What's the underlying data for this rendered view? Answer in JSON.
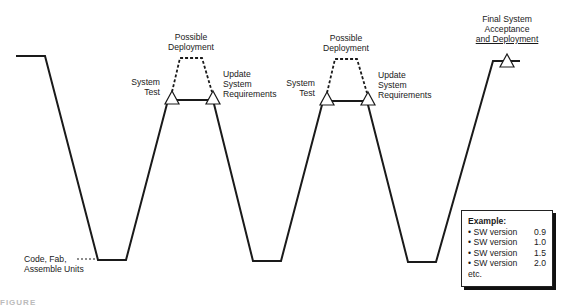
{
  "figure": {
    "caption_fragment": "FIGURE",
    "phases": [
      {
        "top_left": "System Test",
        "top_right": "Update System Requirements",
        "top_mid": "Possible Deployment"
      },
      {
        "top_left": "System Test",
        "top_right": "Update System Requirements",
        "top_mid": "Possible Deployment"
      }
    ],
    "bottom_label": "Code, Fab, Assemble Units",
    "final_label": {
      "line1": "Final System",
      "line2": "Acceptance",
      "line3": "and Deployment"
    },
    "labels": {
      "possible_line1": "Possible",
      "possible_line2": "Deployment",
      "system": "System",
      "test": "Test",
      "update": "Update",
      "req_system": "System",
      "requirements": "Requirements",
      "code1": "Code, Fab,",
      "code2": "Assemble Units"
    },
    "example": {
      "title": "Example:",
      "items": [
        {
          "label": "• SW version",
          "value": "0.9"
        },
        {
          "label": "• SW version",
          "value": "1.0"
        },
        {
          "label": "• SW version",
          "value": "1.5"
        },
        {
          "label": "• SW version",
          "value": "2.0"
        }
      ],
      "footer": "etc."
    }
  }
}
